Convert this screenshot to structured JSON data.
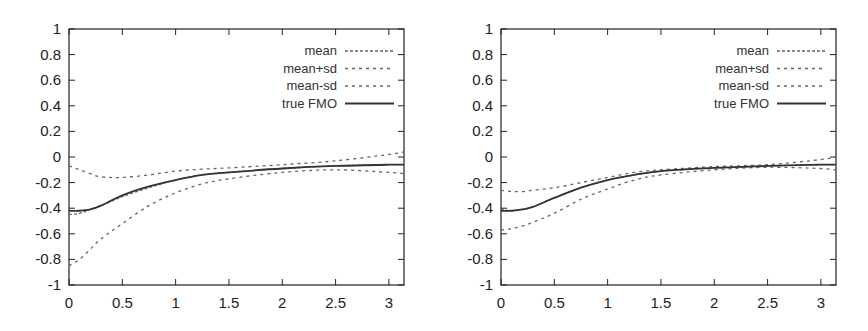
{
  "chart_data": [
    {
      "type": "line",
      "title": "",
      "xlabel": "",
      "ylabel": "",
      "xlim": [
        0,
        3.14159
      ],
      "ylim": [
        -1,
        1
      ],
      "xticks": [
        "0",
        "0.5",
        "1",
        "1.5",
        "2",
        "2.5",
        "3"
      ],
      "yticks": [
        "1",
        "0.8",
        "0.6",
        "0.4",
        "0.2",
        "0",
        "-0.2",
        "-0.4",
        "-0.6",
        "-0.8",
        "-1"
      ],
      "grid": false,
      "legend_position": "upper right",
      "x": [
        0,
        0.1,
        0.2,
        0.3,
        0.5,
        0.75,
        1.0,
        1.25,
        1.5,
        2.0,
        2.5,
        3.0,
        3.14
      ],
      "series": [
        {
          "name": "mean",
          "style": "dashed-fine",
          "values": [
            -0.45,
            -0.44,
            -0.41,
            -0.38,
            -0.31,
            -0.24,
            -0.18,
            -0.14,
            -0.12,
            -0.09,
            -0.07,
            -0.06,
            -0.06
          ]
        },
        {
          "name": "mean+sd",
          "style": "dashed",
          "values": [
            -0.07,
            -0.1,
            -0.13,
            -0.155,
            -0.16,
            -0.14,
            -0.11,
            -0.095,
            -0.085,
            -0.06,
            -0.03,
            0.02,
            0.04
          ]
        },
        {
          "name": "mean-sd",
          "style": "dashed",
          "values": [
            -0.85,
            -0.8,
            -0.72,
            -0.64,
            -0.52,
            -0.38,
            -0.28,
            -0.21,
            -0.17,
            -0.12,
            -0.1,
            -0.12,
            -0.13
          ]
        },
        {
          "name": "true FMO",
          "style": "solid",
          "values": [
            -0.42,
            -0.42,
            -0.41,
            -0.38,
            -0.3,
            -0.23,
            -0.18,
            -0.14,
            -0.12,
            -0.09,
            -0.07,
            -0.06,
            -0.06
          ]
        }
      ]
    },
    {
      "type": "line",
      "title": "",
      "xlabel": "",
      "ylabel": "",
      "xlim": [
        0,
        3.14159
      ],
      "ylim": [
        -1,
        1
      ],
      "xticks": [
        "0",
        "0.5",
        "1",
        "1.5",
        "2",
        "2.5",
        "3"
      ],
      "yticks": [
        "1",
        "0.8",
        "0.6",
        "0.4",
        "0.2",
        "0",
        "-0.2",
        "-0.4",
        "-0.6",
        "-0.8",
        "-1"
      ],
      "grid": false,
      "legend_position": "upper right",
      "x": [
        0,
        0.1,
        0.2,
        0.3,
        0.5,
        0.75,
        1.0,
        1.25,
        1.5,
        2.0,
        2.5,
        3.0,
        3.14
      ],
      "series": [
        {
          "name": "mean",
          "style": "dashed-fine",
          "values": [
            -0.41,
            -0.42,
            -0.41,
            -0.39,
            -0.32,
            -0.24,
            -0.18,
            -0.14,
            -0.11,
            -0.085,
            -0.07,
            -0.06,
            -0.06
          ]
        },
        {
          "name": "mean+sd",
          "style": "dashed",
          "values": [
            -0.26,
            -0.27,
            -0.27,
            -0.26,
            -0.24,
            -0.2,
            -0.16,
            -0.12,
            -0.1,
            -0.075,
            -0.06,
            -0.02,
            0.0
          ]
        },
        {
          "name": "mean-sd",
          "style": "dashed",
          "values": [
            -0.57,
            -0.56,
            -0.54,
            -0.51,
            -0.44,
            -0.33,
            -0.25,
            -0.18,
            -0.14,
            -0.1,
            -0.08,
            -0.09,
            -0.1
          ]
        },
        {
          "name": "true FMO",
          "style": "solid",
          "values": [
            -0.42,
            -0.42,
            -0.41,
            -0.39,
            -0.32,
            -0.24,
            -0.18,
            -0.14,
            -0.11,
            -0.085,
            -0.07,
            -0.06,
            -0.06
          ]
        }
      ]
    }
  ],
  "panels": [
    {
      "frame": {
        "left": 69,
        "top": 29,
        "right": 404,
        "bottom": 285
      }
    },
    {
      "frame": {
        "left": 501,
        "top": 29,
        "right": 836,
        "bottom": 285
      }
    }
  ],
  "colors": {
    "frame": "#222222",
    "solid_line": "#333333",
    "dashed_line": "#666666",
    "text": "#222222"
  }
}
